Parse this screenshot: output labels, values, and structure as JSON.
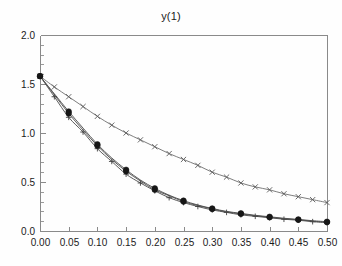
{
  "figure": {
    "background": "#fefefe",
    "width": 342,
    "height": 266
  },
  "title": "y(1)",
  "chart_data": {
    "type": "line",
    "title": "y(1)",
    "xlabel": "",
    "ylabel": "",
    "xlim": [
      0.0,
      0.5
    ],
    "ylim": [
      0.0,
      2.0
    ],
    "grid": false,
    "legend": null,
    "xticks": [
      0.0,
      0.05,
      0.1,
      0.15,
      0.2,
      0.25,
      0.3,
      0.35,
      0.4,
      0.45,
      0.5
    ],
    "xticklabels": [
      "0.00",
      "0.05",
      "0.10",
      "0.15",
      "0.20",
      "0.25",
      "0.30",
      "0.35",
      "0.40",
      "0.45",
      "0.50"
    ],
    "yticks": [
      0.0,
      0.5,
      1.0,
      1.5,
      2.0
    ],
    "yticklabels": [
      "0.0",
      "0.5",
      "1.0",
      "1.5",
      "2.0"
    ],
    "y_minor_tick_step": 0.1,
    "x": [
      0.0,
      0.025,
      0.05,
      0.075,
      0.1,
      0.125,
      0.15,
      0.175,
      0.2,
      0.225,
      0.25,
      0.275,
      0.3,
      0.325,
      0.35,
      0.375,
      0.4,
      0.425,
      0.45,
      0.475,
      0.5
    ],
    "series": [
      {
        "name": "upper-curve",
        "marker": "x",
        "color": "#5a5a5a",
        "values": [
          1.58,
          1.47,
          1.37,
          1.27,
          1.17,
          1.08,
          1.0,
          0.93,
          0.86,
          0.79,
          0.73,
          0.67,
          0.6,
          0.55,
          0.49,
          0.45,
          0.42,
          0.38,
          0.35,
          0.32,
          0.29
        ]
      },
      {
        "name": "lower-curve-plus",
        "marker": "plus",
        "color": "#3f3f3f",
        "values": [
          1.58,
          1.37,
          1.16,
          1.01,
          0.84,
          0.71,
          0.58,
          0.49,
          0.41,
          0.34,
          0.29,
          0.25,
          0.215,
          0.19,
          0.165,
          0.15,
          0.135,
          0.12,
          0.11,
          0.095,
          0.085
        ]
      },
      {
        "name": "lower-curve-dots-a",
        "marker": "circle-filled",
        "color": "#161616",
        "values": [
          1.58,
          1.39,
          1.2,
          1.03,
          0.87,
          0.73,
          0.61,
          0.51,
          0.42,
          0.36,
          0.3,
          0.26,
          0.225,
          0.195,
          0.175,
          0.155,
          0.14,
          0.125,
          0.115,
          0.1,
          0.09
        ]
      },
      {
        "name": "lower-curve-dots-b",
        "marker": "circle-filled",
        "color": "#262626",
        "values": [
          1.58,
          1.4,
          1.22,
          1.05,
          0.885,
          0.745,
          0.625,
          0.52,
          0.435,
          0.365,
          0.31,
          0.265,
          0.23,
          0.2,
          0.18,
          0.16,
          0.145,
          0.13,
          0.118,
          0.105,
          0.095
        ]
      }
    ],
    "marker_x_values": [
      0.0,
      0.05,
      0.1,
      0.15,
      0.2,
      0.25,
      0.3,
      0.35,
      0.4,
      0.45,
      0.5
    ],
    "minor_marker_x_values": [
      0.025,
      0.075,
      0.125,
      0.175,
      0.225,
      0.275,
      0.325,
      0.375,
      0.425,
      0.475
    ]
  },
  "plot_area": {
    "left": 40,
    "top": 35,
    "right": 327,
    "bottom": 231
  }
}
